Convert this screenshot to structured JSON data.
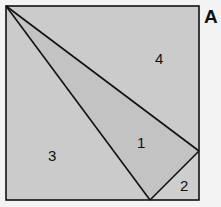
{
  "figure": {
    "panel_label": "A",
    "regions": [
      {
        "id": "1",
        "label": "1",
        "fill": "#c4c4c4"
      },
      {
        "id": "2",
        "label": "2",
        "fill": "#cdcdcd"
      },
      {
        "id": "3",
        "label": "3",
        "fill": "#cbcbcb"
      },
      {
        "id": "4",
        "label": "4",
        "fill": "#cbcbcb"
      }
    ],
    "stroke_color": "#111111",
    "background": "#f3f3f3"
  }
}
